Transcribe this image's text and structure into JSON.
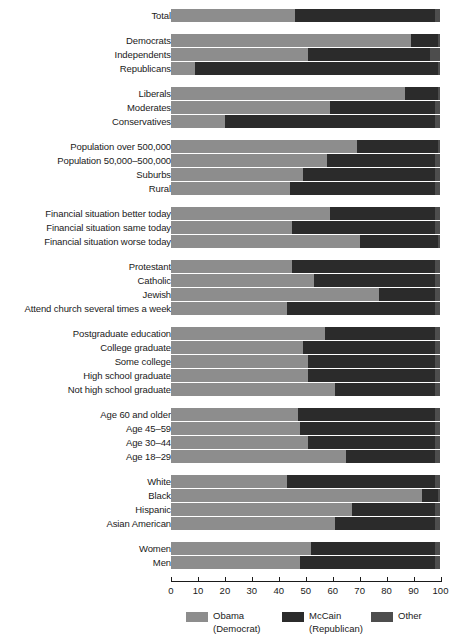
{
  "chart_data": {
    "type": "bar",
    "orientation": "horizontal",
    "stacked": true,
    "title": "",
    "xlabel": "",
    "ylabel": "",
    "xlim": [
      0,
      100
    ],
    "xticks": [
      0,
      10,
      20,
      30,
      40,
      50,
      60,
      70,
      80,
      90,
      100
    ],
    "xtick_labels": [
      "0",
      "10",
      "20",
      "30",
      "40",
      "50",
      "60",
      "70",
      "80",
      "90",
      "100"
    ],
    "grid": false,
    "legend_position": "bottom-center",
    "series": [
      {
        "name": "Obama",
        "sub": "(Democrat)",
        "color": "#8d8d8d"
      },
      {
        "name": "McCain",
        "sub": "(Republican)",
        "color": "#2b2b2b"
      },
      {
        "name": "Other",
        "sub": "",
        "color": "#4d4d4d"
      }
    ],
    "groups": [
      {
        "name": "total",
        "rows": [
          {
            "label": "Total",
            "obama": 46,
            "mccain": 52,
            "other": 2
          }
        ]
      },
      {
        "name": "party",
        "rows": [
          {
            "label": "Democrats",
            "obama": 89,
            "mccain": 10,
            "other": 1
          },
          {
            "label": "Independents",
            "obama": 51,
            "mccain": 45,
            "other": 4
          },
          {
            "label": "Republicans",
            "obama": 9,
            "mccain": 90,
            "other": 1
          }
        ]
      },
      {
        "name": "ideology",
        "rows": [
          {
            "label": "Liberals",
            "obama": 87,
            "mccain": 12,
            "other": 1
          },
          {
            "label": "Moderates",
            "obama": 59,
            "mccain": 39,
            "other": 2
          },
          {
            "label": "Conservatives",
            "obama": 20,
            "mccain": 78,
            "other": 2
          }
        ]
      },
      {
        "name": "community",
        "rows": [
          {
            "label": "Population over 500,000",
            "obama": 69,
            "mccain": 30,
            "other": 1
          },
          {
            "label": "Population 50,000–500,000",
            "obama": 58,
            "mccain": 40,
            "other": 2
          },
          {
            "label": "Suburbs",
            "obama": 49,
            "mccain": 49,
            "other": 2
          },
          {
            "label": "Rural",
            "obama": 44,
            "mccain": 54,
            "other": 2
          }
        ]
      },
      {
        "name": "financial",
        "rows": [
          {
            "label": "Financial situation better today",
            "obama": 59,
            "mccain": 39,
            "other": 2
          },
          {
            "label": "Financial situation same today",
            "obama": 45,
            "mccain": 53,
            "other": 2
          },
          {
            "label": "Financial situation worse today",
            "obama": 70,
            "mccain": 29,
            "other": 1
          }
        ]
      },
      {
        "name": "religion",
        "rows": [
          {
            "label": "Protestant",
            "obama": 45,
            "mccain": 53,
            "other": 2
          },
          {
            "label": "Catholic",
            "obama": 53,
            "mccain": 45,
            "other": 2
          },
          {
            "label": "Jewish",
            "obama": 77,
            "mccain": 21,
            "other": 2
          },
          {
            "label": "Attend church several times a week",
            "obama": 43,
            "mccain": 55,
            "other": 2
          }
        ]
      },
      {
        "name": "education",
        "rows": [
          {
            "label": "Postgraduate education",
            "obama": 57,
            "mccain": 41,
            "other": 2
          },
          {
            "label": "College graduate",
            "obama": 49,
            "mccain": 49,
            "other": 2
          },
          {
            "label": "Some college",
            "obama": 51,
            "mccain": 47,
            "other": 2
          },
          {
            "label": "High school graduate",
            "obama": 51,
            "mccain": 47,
            "other": 2
          },
          {
            "label": "Not high school graduate",
            "obama": 61,
            "mccain": 37,
            "other": 2
          }
        ]
      },
      {
        "name": "age",
        "rows": [
          {
            "label": "Age 60 and older",
            "obama": 47,
            "mccain": 51,
            "other": 2
          },
          {
            "label": "Age 45–59",
            "obama": 48,
            "mccain": 50,
            "other": 2
          },
          {
            "label": "Age 30–44",
            "obama": 51,
            "mccain": 47,
            "other": 2
          },
          {
            "label": "Age 18–29",
            "obama": 65,
            "mccain": 33,
            "other": 2
          }
        ]
      },
      {
        "name": "race",
        "rows": [
          {
            "label": "White",
            "obama": 43,
            "mccain": 55,
            "other": 2
          },
          {
            "label": "Black",
            "obama": 93,
            "mccain": 6,
            "other": 1
          },
          {
            "label": "Hispanic",
            "obama": 67,
            "mccain": 31,
            "other": 2
          },
          {
            "label": "Asian American",
            "obama": 61,
            "mccain": 37,
            "other": 2
          }
        ]
      },
      {
        "name": "gender",
        "rows": [
          {
            "label": "Women",
            "obama": 52,
            "mccain": 46,
            "other": 2
          },
          {
            "label": "Men",
            "obama": 48,
            "mccain": 50,
            "other": 2
          }
        ]
      }
    ]
  },
  "legend": {
    "items": [
      {
        "label": "Obama",
        "sub": "(Democrat)",
        "swatch": "#8d8d8d"
      },
      {
        "label": "McCain",
        "sub": "(Republican)",
        "swatch": "#2b2b2b"
      },
      {
        "label": "Other",
        "sub": "",
        "swatch": "#4d4d4d"
      }
    ]
  }
}
